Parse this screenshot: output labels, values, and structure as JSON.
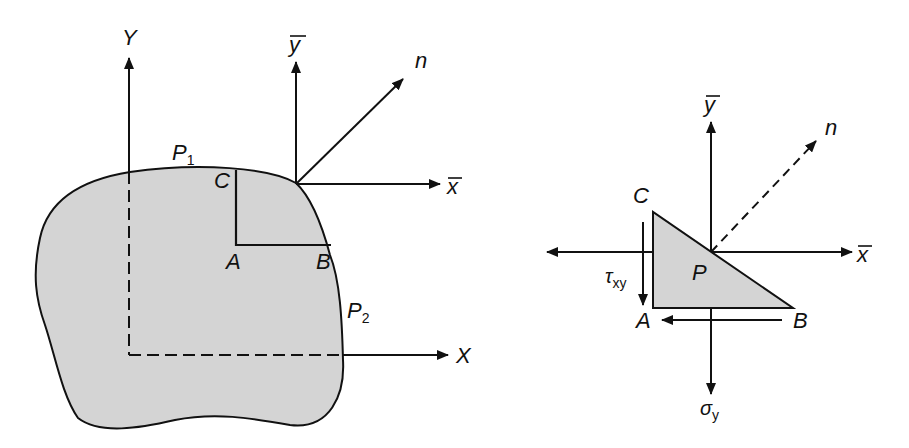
{
  "figure": {
    "left_panel": {
      "description": "Arbitrary body with global axes X,Y and local axes x-bar, y-bar, normal n at boundary point",
      "labels": {
        "Y": "Y",
        "X": "X",
        "ybar": "y",
        "xbar": "x",
        "n": "n",
        "P1": "P",
        "P1_sub": "1",
        "P2": "P",
        "P2_sub": "2",
        "A": "A",
        "B": "B",
        "C": "C"
      },
      "colors": {
        "fill": "#d4d4d4",
        "stroke": "#111111"
      }
    },
    "right_panel": {
      "description": "Free-body triangle element ABC at point P with stresses",
      "labels": {
        "ybar": "y",
        "xbar": "x",
        "n": "n",
        "C": "C",
        "P": "P",
        "A": "A",
        "B": "B",
        "tau": "τ",
        "tau_sub": "xy",
        "sigma": "σ",
        "sigma_sub": "y"
      },
      "colors": {
        "fill": "#d4d4d4",
        "stroke": "#111111"
      }
    }
  }
}
